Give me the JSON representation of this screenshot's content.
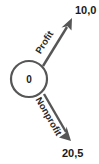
{
  "diagram": {
    "type": "game-tree",
    "root_node": {
      "label": "0",
      "name": "decision-node"
    },
    "branches": [
      {
        "label": "Profit",
        "direction": "up-right",
        "payoff": "10,0"
      },
      {
        "label": "Nonprofit",
        "direction": "down-right",
        "payoff": "20,5"
      }
    ],
    "payoffs": {
      "profit_outcome": "10,0",
      "nonprofit_outcome": "20,5"
    },
    "colors": {
      "line": "#565656",
      "text": "#1a1a1a",
      "background": "#ffffff"
    }
  }
}
